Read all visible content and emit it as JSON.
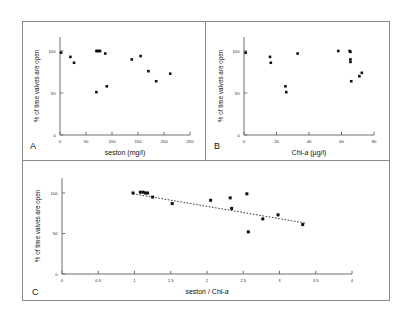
{
  "figure": {
    "background": "#ffffff",
    "frame_color": "#8a8a8a",
    "marker_color": "#111111",
    "trendline_color": "#222222"
  },
  "panels": [
    {
      "letter": "A",
      "name": "panel-a"
    },
    {
      "letter": "B",
      "name": "panel-b"
    },
    {
      "letter": "C",
      "name": "panel-c"
    }
  ],
  "chart_data": [
    {
      "type": "scatter",
      "panel": "A",
      "title": "",
      "xlabel": "seston (mg/l)",
      "ylabel": "% of time valves are open",
      "xlim": [
        0,
        250
      ],
      "ylim": [
        0,
        100
      ],
      "xticks": [
        0,
        50,
        100,
        150,
        200,
        250
      ],
      "xticklabels": [
        "0",
        "50",
        "100",
        "150",
        "200",
        "250"
      ],
      "yticks": [
        0,
        50,
        100
      ],
      "yticklabels": [
        "0",
        "50",
        "100"
      ],
      "grid": false,
      "legend": null,
      "x": [
        2,
        20,
        27,
        70,
        72,
        75,
        77,
        87,
        70,
        90,
        138,
        155,
        170,
        185,
        212
      ],
      "y": [
        98,
        93,
        86,
        100,
        100,
        100,
        100,
        97,
        51,
        58,
        90,
        94,
        76,
        64,
        73
      ]
    },
    {
      "type": "scatter",
      "panel": "B",
      "title": "",
      "xlabel": "Chl-a (µg/l)",
      "ylabel": "% of time valves are open",
      "xlim": [
        0,
        80
      ],
      "ylim": [
        0,
        100
      ],
      "xticks": [
        0,
        20,
        40,
        60,
        80
      ],
      "xticklabels": [
        "0",
        "20",
        "40",
        "60",
        "80"
      ],
      "yticks": [
        0,
        50,
        100
      ],
      "yticklabels": [
        "0",
        "50",
        "100"
      ],
      "grid": false,
      "legend": null,
      "x": [
        1,
        16,
        16.5,
        25.5,
        26,
        33,
        58,
        65,
        65.5,
        65.5,
        65.5,
        66,
        71,
        72.5
      ],
      "y": [
        98,
        93,
        86,
        58,
        51,
        97,
        100,
        100,
        99,
        90,
        87,
        64,
        70,
        74
      ]
    },
    {
      "type": "scatter",
      "panel": "C",
      "title": "",
      "xlabel": "seston / Chl-a",
      "ylabel": "% of time valves are open",
      "xlim": [
        0,
        4
      ],
      "ylim": [
        0,
        100
      ],
      "xticks": [
        0,
        0.5,
        1,
        1.5,
        2,
        2.5,
        3,
        3.5,
        4
      ],
      "xticklabels": [
        "0",
        "0.5",
        "1",
        "1.5",
        "2",
        "2.5",
        "3",
        "3.5",
        "4"
      ],
      "yticks": [
        0,
        50,
        100
      ],
      "yticklabels": [
        "0",
        "50",
        "100"
      ],
      "grid": false,
      "legend": null,
      "x": [
        0.98,
        1.08,
        1.12,
        1.15,
        1.18,
        1.25,
        1.52,
        2.05,
        2.32,
        2.34,
        2.55,
        2.57,
        2.77,
        2.98,
        3.32
      ],
      "y": [
        100,
        101,
        101,
        100,
        100,
        95,
        87,
        91,
        94,
        81,
        99,
        52,
        68,
        73,
        61
      ],
      "trendline": {
        "type": "linear",
        "style": "dotted",
        "x": [
          0.98,
          3.35
        ],
        "y": [
          99,
          63
        ]
      }
    }
  ]
}
